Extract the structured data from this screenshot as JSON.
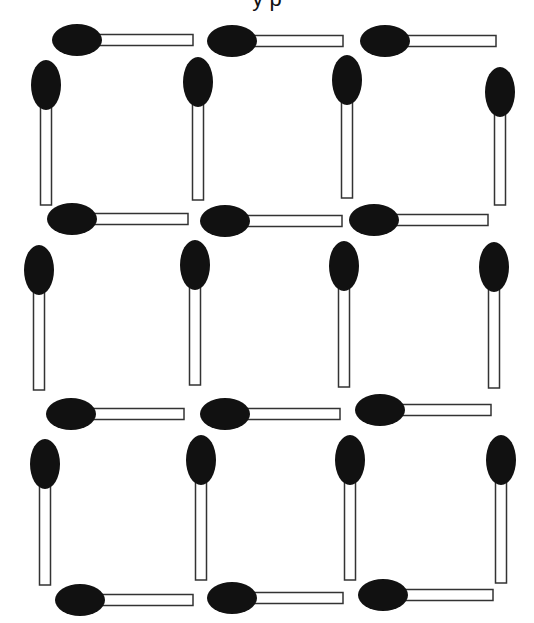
{
  "puzzle": {
    "caption_fragment": "y        p",
    "grid": {
      "rows": 3,
      "cols": 3
    },
    "colors": {
      "head": "#111111",
      "stick_fill": "#ffffff",
      "stick_stroke": "#333333",
      "background": "#ffffff"
    },
    "horizontal_matchsticks": [
      {
        "id": "h-r1-c1",
        "cx": 77,
        "cy": 40,
        "end": 193
      },
      {
        "id": "h-r1-c2",
        "cx": 232,
        "cy": 41,
        "end": 343
      },
      {
        "id": "h-r1-c3",
        "cx": 385,
        "cy": 41,
        "end": 496
      },
      {
        "id": "h-r2-c1",
        "cx": 72,
        "cy": 219,
        "end": 188
      },
      {
        "id": "h-r2-c2",
        "cx": 225,
        "cy": 221,
        "end": 342
      },
      {
        "id": "h-r2-c3",
        "cx": 374,
        "cy": 220,
        "end": 488
      },
      {
        "id": "h-r3-c1",
        "cx": 71,
        "cy": 414,
        "end": 184
      },
      {
        "id": "h-r3-c2",
        "cx": 225,
        "cy": 414,
        "end": 340
      },
      {
        "id": "h-r3-c3",
        "cx": 380,
        "cy": 410,
        "end": 491
      },
      {
        "id": "h-r4-c1",
        "cx": 80,
        "cy": 600,
        "end": 193
      },
      {
        "id": "h-r4-c2",
        "cx": 232,
        "cy": 598,
        "end": 343
      },
      {
        "id": "h-r4-c3",
        "cx": 383,
        "cy": 595,
        "end": 493
      }
    ],
    "vertical_matchsticks": [
      {
        "id": "v-r1-c1",
        "cx": 46,
        "cy": 85,
        "end": 205
      },
      {
        "id": "v-r1-c2",
        "cx": 198,
        "cy": 82,
        "end": 200
      },
      {
        "id": "v-r1-c3",
        "cx": 347,
        "cy": 80,
        "end": 198
      },
      {
        "id": "v-r1-c4",
        "cx": 500,
        "cy": 92,
        "end": 205
      },
      {
        "id": "v-r2-c1",
        "cx": 39,
        "cy": 270,
        "end": 390
      },
      {
        "id": "v-r2-c2",
        "cx": 195,
        "cy": 265,
        "end": 385
      },
      {
        "id": "v-r2-c3",
        "cx": 344,
        "cy": 266,
        "end": 387
      },
      {
        "id": "v-r2-c4",
        "cx": 494,
        "cy": 267,
        "end": 388
      },
      {
        "id": "v-r3-c1",
        "cx": 45,
        "cy": 464,
        "end": 585
      },
      {
        "id": "v-r3-c2",
        "cx": 201,
        "cy": 460,
        "end": 580
      },
      {
        "id": "v-r3-c3",
        "cx": 350,
        "cy": 460,
        "end": 580
      },
      {
        "id": "v-r3-c4",
        "cx": 501,
        "cy": 460,
        "end": 583
      }
    ]
  }
}
